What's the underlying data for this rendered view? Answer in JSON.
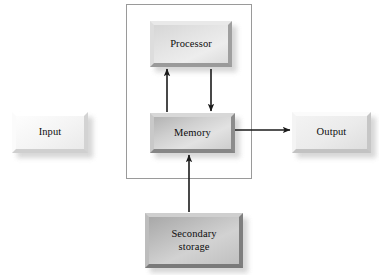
{
  "diagram": {
    "background_color": "#ffffff",
    "line_color": "#1a1a1a",
    "enclosure": {
      "name": "cpu-memory-enclosure",
      "border_color": "#9a9a9a",
      "x": 126,
      "y": 4,
      "width": 126,
      "height": 175
    },
    "nodes": [
      {
        "id": "processor",
        "label": "Processor",
        "tone": "mid",
        "x": 150,
        "y": 21,
        "width": 82,
        "height": 46,
        "font_size": 10.5
      },
      {
        "id": "memory",
        "label": "Memory",
        "tone": "dark",
        "x": 150,
        "y": 113,
        "width": 85,
        "height": 40,
        "font_size": 10.5
      },
      {
        "id": "input",
        "label": "Input",
        "tone": "tone-white",
        "x": 12,
        "y": 112,
        "width": 76,
        "height": 41,
        "font_size": 10.5
      },
      {
        "id": "output",
        "label": "Output",
        "tone": "light",
        "x": 292,
        "y": 112,
        "width": 79,
        "height": 41,
        "font_size": 10.5
      },
      {
        "id": "secondary-storage",
        "label": "Secondary\nstorage",
        "tone": "darker",
        "x": 145,
        "y": 213,
        "width": 98,
        "height": 55,
        "font_size": 10.5
      }
    ],
    "connections": [
      {
        "id": "memory-to-processor",
        "from": "memory",
        "to": "processor",
        "direction": "up",
        "x1": 167,
        "y1": 112,
        "x2": 167,
        "y2": 69
      },
      {
        "id": "processor-to-memory",
        "from": "processor",
        "to": "memory",
        "direction": "down",
        "x1": 211,
        "y1": 69,
        "x2": 211,
        "y2": 111
      },
      {
        "id": "memory-to-output",
        "from": "memory",
        "to": "output",
        "direction": "right",
        "x1": 235,
        "y1": 130,
        "x2": 290,
        "y2": 130
      },
      {
        "id": "secondary-storage-to-memory",
        "from": "secondary-storage",
        "to": "memory",
        "direction": "up",
        "x1": 189,
        "y1": 212,
        "x2": 189,
        "y2": 155
      }
    ]
  }
}
